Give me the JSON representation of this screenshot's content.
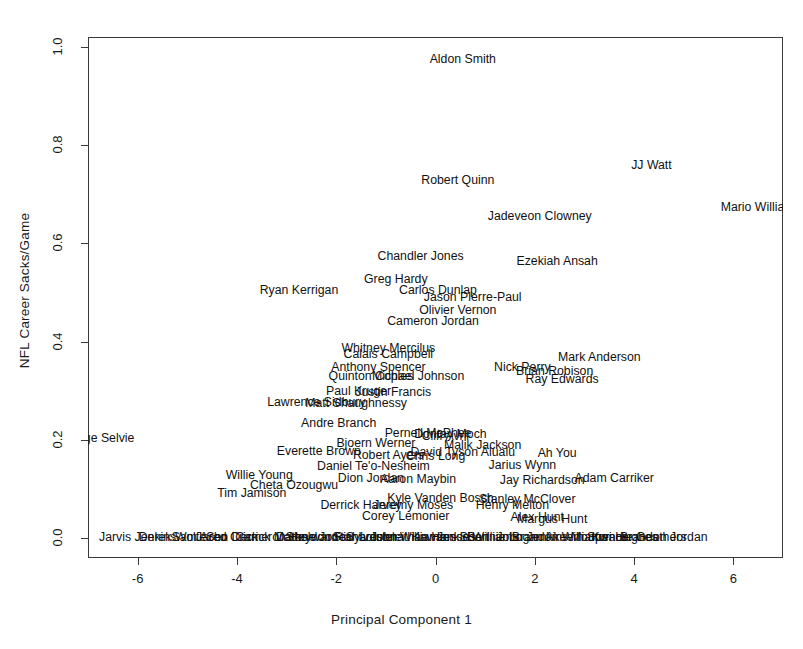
{
  "chart_data": {
    "type": "scatter",
    "title": "",
    "xlabel": "Principal Component 1",
    "ylabel": "NFL Career Sacks/Game",
    "xlim": [
      -7.0,
      7.0
    ],
    "ylim": [
      -0.04,
      1.02
    ],
    "xticks": [
      -6,
      -4,
      -2,
      0,
      2,
      4,
      6
    ],
    "xticklabels": [
      "-6",
      "-4",
      "-2",
      "0",
      "2",
      "4",
      "6"
    ],
    "yticks": [
      0.0,
      0.2,
      0.4,
      0.6,
      0.8,
      1.0
    ],
    "yticklabels": [
      "0.0",
      "0.2",
      "0.4",
      "0.6",
      "0.8",
      "1.0"
    ],
    "grid": false,
    "legend": null,
    "marker_style": "text-labels",
    "points": [
      {
        "label": "Aldon Smith",
        "x": 0.55,
        "y": 0.975
      },
      {
        "label": "JJ Watt",
        "x": 4.35,
        "y": 0.76
      },
      {
        "label": "Robert Quinn",
        "x": 0.45,
        "y": 0.73
      },
      {
        "label": "Mario Williams",
        "x": 6.55,
        "y": 0.675
      },
      {
        "label": "Jadeveon Clowney",
        "x": 2.1,
        "y": 0.655
      },
      {
        "label": "Chandler Jones",
        "x": -0.3,
        "y": 0.575
      },
      {
        "label": "Ezekiah Ansah",
        "x": 2.45,
        "y": 0.565
      },
      {
        "label": "Greg Hardy",
        "x": -0.8,
        "y": 0.528
      },
      {
        "label": "Ryan Kerrigan",
        "x": -2.75,
        "y": 0.505
      },
      {
        "label": "Carlos Dunlap",
        "x": 0.05,
        "y": 0.505
      },
      {
        "label": "Jason Pierre-Paul",
        "x": 0.75,
        "y": 0.492
      },
      {
        "label": "Olivier Vernon",
        "x": 0.45,
        "y": 0.465
      },
      {
        "label": "Cameron Jordan",
        "x": -0.05,
        "y": 0.443
      },
      {
        "label": "Whitney Mercilus",
        "x": -0.95,
        "y": 0.388
      },
      {
        "label": "Calais Campbell",
        "x": -0.95,
        "y": 0.375
      },
      {
        "label": "Mark Anderson",
        "x": 3.3,
        "y": 0.368
      },
      {
        "label": "Anthony Spencer",
        "x": -1.15,
        "y": 0.348
      },
      {
        "label": "Nick Perry",
        "x": 1.75,
        "y": 0.348
      },
      {
        "label": "Brian Robison",
        "x": 2.4,
        "y": 0.34
      },
      {
        "label": "Quinton Coples",
        "x": -1.3,
        "y": 0.33
      },
      {
        "label": "Michael Johnson",
        "x": -0.35,
        "y": 0.33
      },
      {
        "label": "Ray Edwards",
        "x": 2.55,
        "y": 0.325
      },
      {
        "label": "Paul Kruger",
        "x": -1.55,
        "y": 0.3
      },
      {
        "label": "Justin Francis",
        "x": -0.85,
        "y": 0.298
      },
      {
        "label": "Lawrence Sidbury",
        "x": -2.4,
        "y": 0.278
      },
      {
        "label": "Matt Shaughnessy",
        "x": -1.6,
        "y": 0.275
      },
      {
        "label": "Andre Branch",
        "x": -1.95,
        "y": 0.235
      },
      {
        "label": "Pernell McPhee",
        "x": -0.15,
        "y": 0.215
      },
      {
        "label": "Dontay Moch",
        "x": 0.3,
        "y": 0.213
      },
      {
        "label": "Cliff Avril",
        "x": 0.2,
        "y": 0.208
      },
      {
        "label": "George Selvie",
        "x": -6.85,
        "y": 0.205
      },
      {
        "label": "Bjoern Werner",
        "x": -1.2,
        "y": 0.193
      },
      {
        "label": "Malik Jackson",
        "x": 0.95,
        "y": 0.19
      },
      {
        "label": "Everette Brown",
        "x": -2.35,
        "y": 0.178
      },
      {
        "label": "David Tyson Alualu",
        "x": 0.55,
        "y": 0.175
      },
      {
        "label": "Robert Ayers",
        "x": -0.95,
        "y": 0.17
      },
      {
        "label": "Chris Long",
        "x": 0.0,
        "y": 0.168
      },
      {
        "label": "Ah You",
        "x": 2.45,
        "y": 0.173
      },
      {
        "label": "Daniel Te'o-Nesheim",
        "x": -1.25,
        "y": 0.148
      },
      {
        "label": "Jarius Wynn",
        "x": 1.75,
        "y": 0.15
      },
      {
        "label": "Willie Young",
        "x": -3.55,
        "y": 0.128
      },
      {
        "label": "Dion Jordan",
        "x": -1.3,
        "y": 0.122
      },
      {
        "label": "Aaron Maybin",
        "x": -0.35,
        "y": 0.12
      },
      {
        "label": "Jay Richardson",
        "x": 2.15,
        "y": 0.118
      },
      {
        "label": "Adam Carriker",
        "x": 3.6,
        "y": 0.122
      },
      {
        "label": "Cheta Ozougwu",
        "x": -2.85,
        "y": 0.108
      },
      {
        "label": "Tim Jamison",
        "x": -3.7,
        "y": 0.093
      },
      {
        "label": "Kyle Vanden Bosch",
        "x": 0.1,
        "y": 0.083
      },
      {
        "label": "Stanley McClover",
        "x": 1.85,
        "y": 0.08
      },
      {
        "label": "Derrick Harvey",
        "x": -1.5,
        "y": 0.068
      },
      {
        "label": "Jeremy Moses",
        "x": -0.45,
        "y": 0.067
      },
      {
        "label": "Henry Melton",
        "x": 1.55,
        "y": 0.067
      },
      {
        "label": "Corey Lemonier",
        "x": -0.6,
        "y": 0.045
      },
      {
        "label": "Alex Hunt",
        "x": 2.05,
        "y": 0.043
      },
      {
        "label": "Margus Hunt",
        "x": 2.35,
        "y": 0.04
      },
      {
        "label": "Jarvis Jenkins",
        "x": -6.0,
        "y": 0.002
      },
      {
        "label": "Derek Wolfe",
        "x": -5.3,
        "y": 0.002
      },
      {
        "label": "Sam Acho",
        "x": -4.75,
        "y": 0.002
      },
      {
        "label": "Jared Crick",
        "x": -4.2,
        "y": 0.002
      },
      {
        "label": "Sen Derrick Marks",
        "x": -3.6,
        "y": 0.002
      },
      {
        "label": "Cameron Heyward",
        "x": -3.0,
        "y": 0.002
      },
      {
        "label": "Datone Jones",
        "x": -2.45,
        "y": 0.002
      },
      {
        "label": "Sheldon Richardson",
        "x": -1.9,
        "y": 0.002
      },
      {
        "label": "Star Lotulelei",
        "x": -1.35,
        "y": 0.002
      },
      {
        "label": "Sylvester Williams",
        "x": -0.8,
        "y": 0.002
      },
      {
        "label": "Johnathan Hankins",
        "x": -0.25,
        "y": 0.002
      },
      {
        "label": "Kawann Short",
        "x": 0.3,
        "y": 0.002
      },
      {
        "label": "Jesse Williams",
        "x": 0.85,
        "y": 0.002
      },
      {
        "label": "Bennie Logan",
        "x": 1.4,
        "y": 0.002
      },
      {
        "label": "John Jenkins",
        "x": 1.95,
        "y": 0.002
      },
      {
        "label": "Brandon Williams",
        "x": 2.5,
        "y": 0.002
      },
      {
        "label": "Akeem Spence",
        "x": 3.05,
        "y": 0.002
      },
      {
        "label": "Montori Hughes",
        "x": 3.6,
        "y": 0.002
      },
      {
        "label": "Kwame Geathers",
        "x": 4.1,
        "y": 0.002
      },
      {
        "label": "Brandon Jordan",
        "x": 4.6,
        "y": 0.002
      }
    ]
  }
}
